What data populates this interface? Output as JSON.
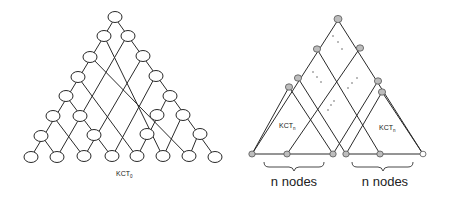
{
  "figure": {
    "left": {
      "caption": "KCT",
      "caption_subscript": "0",
      "node_style": "hollow-ellipse",
      "rows": 8
    },
    "right": {
      "subtree_left_label": "KCT",
      "subtree_left_subscript": "n",
      "subtree_right_label": "KCT",
      "subtree_right_subscript": "n",
      "brace_left_label": "n nodes",
      "brace_right_label": "n nodes",
      "ellipsis": "..."
    },
    "colors": {
      "line": "#2a2a2a",
      "node_fill_right": "#bdbdbd",
      "background": "#ffffff"
    }
  }
}
